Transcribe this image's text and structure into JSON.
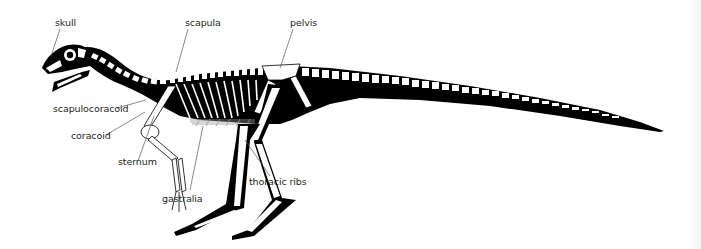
{
  "figure": {
    "background": "#ffffff",
    "ink_color": "#000000",
    "label_color": "#231f20",
    "leader_color": "#555555"
  },
  "labels": {
    "skull": "skull",
    "scapula": "scapula",
    "pelvis": "pelvis",
    "scapulocoracoid": "scapulocoracoid",
    "coracoid": "coracoid",
    "sternum": "sternum",
    "gastralia": "gastralia",
    "thoracic_ribs": "thoracic ribs"
  }
}
